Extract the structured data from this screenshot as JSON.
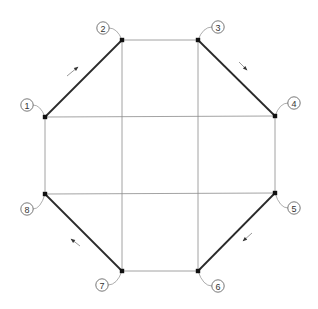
{
  "diagram": {
    "type": "octagon-node-graph",
    "colors": {
      "thin_line": "#8c8c8c",
      "thick_edge": "#2a2a2a",
      "node": "#111111",
      "label_stroke": "#555555"
    },
    "nodes": [
      {
        "id": "1",
        "label": "1",
        "x": 45,
        "y": 117,
        "lx": 27,
        "ly": 105
      },
      {
        "id": "2",
        "label": "2",
        "x": 122,
        "y": 40,
        "lx": 103,
        "ly": 28
      },
      {
        "id": "3",
        "label": "3",
        "x": 198,
        "y": 40,
        "lx": 218,
        "ly": 27
      },
      {
        "id": "4",
        "label": "4",
        "x": 275,
        "y": 116,
        "lx": 294,
        "ly": 103
      },
      {
        "id": "5",
        "label": "5",
        "x": 275,
        "y": 193,
        "lx": 294,
        "ly": 208
      },
      {
        "id": "6",
        "label": "6",
        "x": 198,
        "y": 271,
        "lx": 218,
        "ly": 286
      },
      {
        "id": "7",
        "label": "7",
        "x": 122,
        "y": 271,
        "lx": 102,
        "ly": 285
      },
      {
        "id": "8",
        "label": "8",
        "x": 45,
        "y": 194,
        "lx": 27,
        "ly": 209
      }
    ],
    "thick_edges": [
      {
        "from": "1",
        "to": "2"
      },
      {
        "from": "3",
        "to": "4"
      },
      {
        "from": "5",
        "to": "6"
      },
      {
        "from": "7",
        "to": "8"
      }
    ],
    "thin_edges": [
      {
        "from": "2",
        "to": "3"
      },
      {
        "from": "4",
        "to": "5"
      },
      {
        "from": "6",
        "to": "7"
      },
      {
        "from": "8",
        "to": "1"
      },
      {
        "from": "1",
        "to": "4"
      },
      {
        "from": "8",
        "to": "5"
      },
      {
        "from": "2",
        "to": "7"
      },
      {
        "from": "3",
        "to": "6"
      }
    ],
    "arrows": [
      {
        "name": "arrow-1-2",
        "x1": 67,
        "y1": 76,
        "x2": 78,
        "y2": 67
      },
      {
        "name": "arrow-3-4",
        "x1": 239,
        "y1": 62,
        "x2": 247,
        "y2": 70
      },
      {
        "name": "arrow-5-6",
        "x1": 252,
        "y1": 233,
        "x2": 243,
        "y2": 241
      },
      {
        "name": "arrow-8-7",
        "x1": 80,
        "y1": 246,
        "x2": 71,
        "y2": 239
      }
    ]
  }
}
